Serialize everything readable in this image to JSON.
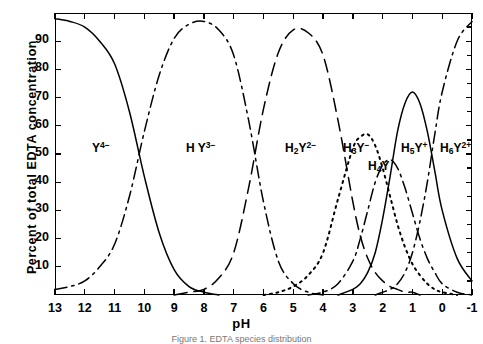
{
  "axes": {
    "ylabel": "Percent of total EDTA concentration",
    "xlabel": "pH",
    "caption": "Figure 1.  EDTA species distribution",
    "xticks": [
      "13",
      "12",
      "11",
      "10",
      "9",
      "8",
      "7",
      "6",
      "5",
      "4",
      "3",
      "2",
      "1",
      "0",
      "-1"
    ],
    "yticks": [
      "90",
      "80",
      "70",
      "60",
      "50",
      "40",
      "30",
      "20",
      "10"
    ]
  },
  "species": [
    {
      "key": "Y4",
      "html": "Y<sup>4−</sup>",
      "x": 92,
      "y": 140
    },
    {
      "key": "HY3",
      "html": "H Y<sup>3−</sup>",
      "x": 186,
      "y": 140
    },
    {
      "key": "H2Y2",
      "html": "H<sub>2</sub>Y<sup>2−</sup>",
      "x": 285,
      "y": 140
    },
    {
      "key": "H3Y",
      "html": "H<sub>3</sub>Y<sup>−</sup>",
      "x": 343,
      "y": 140
    },
    {
      "key": "H4Y",
      "html": "H<sub>4</sub>Y",
      "x": 368,
      "y": 159
    },
    {
      "key": "H5Y",
      "html": "H<sub>5</sub>Y<sup>+</sup>",
      "x": 401,
      "y": 140
    },
    {
      "key": "H6Y2",
      "html": "H<sub>6</sub>Y<sup>2+</sup>",
      "x": 440,
      "y": 140
    }
  ],
  "chart_data": {
    "type": "line",
    "title": "EDTA species distribution",
    "xlabel": "pH",
    "ylabel": "Percent of total EDTA concentration",
    "xlim": [
      13,
      -1
    ],
    "ylim": [
      0,
      100
    ],
    "x_reversed": true,
    "grid": false,
    "legend": "inline-labels",
    "x": [
      13,
      12.5,
      12,
      11.5,
      11,
      10.5,
      10,
      9.5,
      9,
      8.5,
      8,
      7.5,
      7,
      6.5,
      6,
      5.5,
      5,
      4.5,
      4,
      3.5,
      3,
      2.75,
      2.5,
      2.25,
      2,
      1.75,
      1.5,
      1.25,
      1,
      0.75,
      0.5,
      0.25,
      0,
      -0.5,
      -1
    ],
    "series": [
      {
        "name": "Y4-",
        "label": "Y⁴⁻",
        "style": "solid",
        "pKa": 10.26,
        "values": [
          98,
          97,
          95,
          90,
          82,
          65,
          42,
          22,
          9,
          3,
          1,
          0,
          0,
          0,
          0,
          0,
          0,
          0,
          0,
          0,
          0,
          0,
          0,
          0,
          0,
          0,
          0,
          0,
          0,
          0,
          0,
          0,
          0,
          0,
          0
        ]
      },
      {
        "name": "HY3-",
        "label": "HY³⁻",
        "style": "dashdot",
        "pKa_lo": 10.26,
        "pKa_hi": 6.16,
        "values": [
          2,
          3,
          5,
          10,
          18,
          35,
          58,
          78,
          91,
          96,
          97,
          94,
          85,
          62,
          33,
          12,
          4,
          1,
          0,
          0,
          0,
          0,
          0,
          0,
          0,
          0,
          0,
          0,
          0,
          0,
          0,
          0,
          0,
          0,
          0
        ]
      },
      {
        "name": "H2Y2-",
        "label": "H₂Y²⁻",
        "style": "longdash",
        "pKa_lo": 6.16,
        "pKa_hi": 2.67,
        "values": [
          0,
          0,
          0,
          0,
          0,
          0,
          0,
          0,
          0,
          1,
          2,
          6,
          15,
          38,
          66,
          86,
          94,
          93,
          85,
          62,
          33,
          21,
          13,
          8,
          5,
          3,
          2,
          1,
          1,
          0,
          0,
          0,
          0,
          0,
          0
        ]
      },
      {
        "name": "H3Y-",
        "label": "H₃Y⁻",
        "style": "dotted",
        "pKa_lo": 2.67,
        "pKa_hi": 2.0,
        "values": [
          0,
          0,
          0,
          0,
          0,
          0,
          0,
          0,
          0,
          0,
          0,
          0,
          0,
          0,
          0,
          1,
          3,
          7,
          15,
          34,
          52,
          56,
          57,
          53,
          45,
          35,
          25,
          17,
          11,
          7,
          4,
          2,
          1,
          0,
          0
        ]
      },
      {
        "name": "H4Y",
        "label": "H₄Y",
        "style": "dashdot",
        "pKa_lo": 2.0,
        "pKa_hi": 1.5,
        "values": [
          0,
          0,
          0,
          0,
          0,
          0,
          0,
          0,
          0,
          0,
          0,
          0,
          0,
          0,
          0,
          0,
          0,
          0,
          1,
          4,
          12,
          20,
          30,
          40,
          46,
          48,
          45,
          38,
          29,
          20,
          13,
          8,
          4,
          1,
          0
        ]
      },
      {
        "name": "H5Y+",
        "label": "H₅Y⁺",
        "style": "solid",
        "pKa_lo": 1.5,
        "pKa_hi": 0.9,
        "values": [
          0,
          0,
          0,
          0,
          0,
          0,
          0,
          0,
          0,
          0,
          0,
          0,
          0,
          0,
          0,
          0,
          0,
          0,
          0,
          0,
          2,
          4,
          8,
          15,
          27,
          42,
          58,
          68,
          72,
          68,
          58,
          44,
          30,
          13,
          5
        ]
      },
      {
        "name": "H6Y2+",
        "label": "H₆Y²⁺",
        "style": "dashdot",
        "pKa_hi": 0.9,
        "values": [
          0,
          0,
          0,
          0,
          0,
          0,
          0,
          0,
          0,
          0,
          0,
          0,
          0,
          0,
          0,
          0,
          0,
          0,
          0,
          0,
          0,
          0,
          0,
          0,
          1,
          2,
          4,
          8,
          15,
          26,
          40,
          57,
          72,
          90,
          97
        ]
      }
    ]
  }
}
